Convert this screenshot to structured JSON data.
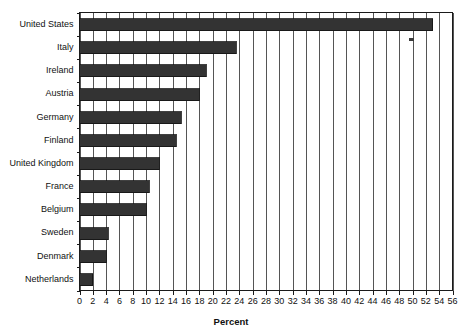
{
  "chart_data": {
    "type": "bar",
    "orientation": "horizontal",
    "title": "",
    "xlabel": "Percent",
    "ylabel": "",
    "xlim": [
      0,
      56
    ],
    "xtick_step": 2,
    "xticks": [
      0,
      2,
      4,
      6,
      8,
      10,
      12,
      14,
      16,
      18,
      20,
      22,
      24,
      26,
      28,
      30,
      32,
      34,
      36,
      38,
      40,
      42,
      44,
      46,
      48,
      50,
      52,
      54,
      56
    ],
    "grid": "vertical",
    "legend": "none",
    "bar_color": "#333333",
    "categories": [
      "United States",
      "Italy",
      "Ireland",
      "Austria",
      "Germany",
      "Finland",
      "United Kingdom",
      "France",
      "Belgium",
      "Sweden",
      "Denmark",
      "Netherlands"
    ],
    "values": [
      53.0,
      23.5,
      19.0,
      18.0,
      15.3,
      14.5,
      12.0,
      10.5,
      10.0,
      4.3,
      4.0,
      2.0
    ]
  },
  "colors": {
    "bar": "#333333",
    "axis": "#1a1a1a",
    "grid": "#555555",
    "background": "#ffffff",
    "text": "#111111"
  },
  "annotations": {
    "scan_artifact_label": "scan-speck"
  }
}
